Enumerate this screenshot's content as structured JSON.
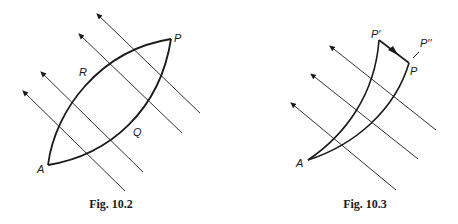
{
  "figures": [
    {
      "caption": "Fig. 10.2",
      "labels": {
        "P": "P",
        "R": "R",
        "Q": "Q",
        "A": "A"
      }
    },
    {
      "caption": "Fig. 10.3",
      "labels": {
        "P_prime": "P′",
        "P_double_prime": "P′′",
        "P": "P",
        "A": "A"
      }
    }
  ],
  "colors": {
    "ink": "#1a1a1a",
    "background": "#ffffff"
  }
}
